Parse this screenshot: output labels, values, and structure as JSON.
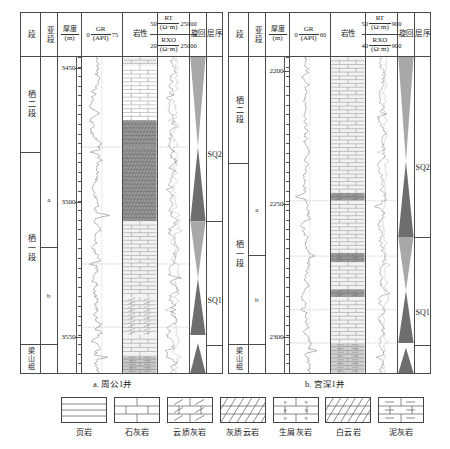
{
  "figure": {
    "captions": {
      "a": "a. 周公1井",
      "b": "b. 宫深1井"
    }
  },
  "headers": {
    "duan": "段",
    "subduan": "亚段",
    "thickness_num": "厚度",
    "thickness_den": "(m)",
    "gr_num": "GR",
    "gr_den": "(API)",
    "lithology": "岩性",
    "rt_num": "RT",
    "rt_den": "(Ω·m)",
    "rxo_num": "RXO",
    "rxo_den": "(Ω·m)",
    "cycle": "旋回",
    "sequence": "层序"
  },
  "panel_a": {
    "well": "周公1井",
    "gr_min": "0",
    "gr_max": "75",
    "rt_min": "50",
    "rt_max": "25000",
    "rxo_min": "20",
    "rxo_max": "25000",
    "depth_labels": [
      "3450",
      "3500",
      "3550"
    ],
    "strat": [
      {
        "name": "栖二段",
        "sub": ""
      },
      {
        "name": "栖一段",
        "sub": "a"
      },
      {
        "name": "",
        "sub": "b"
      },
      {
        "name": "梁山组",
        "sub": ""
      }
    ],
    "sequences": [
      "SQ2",
      "SQ1"
    ]
  },
  "panel_b": {
    "well": "宫深1井",
    "gr_min": "0",
    "gr_max": "60",
    "rt_min": "50",
    "rt_max": "900",
    "rxo_min": "40",
    "rxo_max": "900",
    "depth_labels": [
      "2200",
      "2250",
      "2300"
    ],
    "strat": [
      {
        "name": "栖二段",
        "sub": ""
      },
      {
        "name": "栖一段",
        "sub": "a"
      },
      {
        "name": "",
        "sub": "b"
      },
      {
        "name": "梁山组",
        "sub": ""
      }
    ],
    "sequences": [
      "SQ2",
      "SQ1"
    ]
  },
  "legend": [
    {
      "key": "shale",
      "label": "页岩"
    },
    {
      "key": "limestone",
      "label": "石灰岩"
    },
    {
      "key": "dolomitic-limestone",
      "label": "云质灰岩"
    },
    {
      "key": "calcareous-dolomite",
      "label": "灰质云岩"
    },
    {
      "key": "bioclastic-limestone",
      "label": "生屑灰岩"
    },
    {
      "key": "dolomite",
      "label": "白云岩"
    },
    {
      "key": "marl",
      "label": "泥灰岩"
    }
  ],
  "colors": {
    "line": "#4a4a4a",
    "curve": "#5a5a5a",
    "cycle_dark": "#6e6e6e",
    "cycle_light": "#a8a8a8",
    "lith_gray": "#9a9a9a",
    "lith_white": "#f2f2f0"
  }
}
